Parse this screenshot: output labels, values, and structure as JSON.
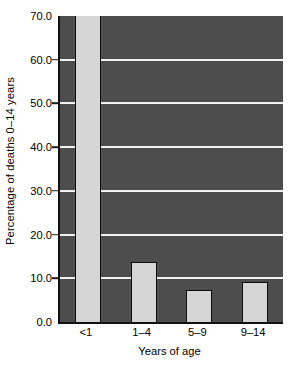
{
  "chart_data": {
    "type": "bar",
    "title": "",
    "xlabel": "Years of age",
    "ylabel": "Percentage of deaths 0–14 years",
    "categories": [
      "<1",
      "1–4",
      "5–9",
      "9–14"
    ],
    "values": [
      70.0,
      13.7,
      7.3,
      9.2
    ],
    "ylim": [
      0.0,
      70.0
    ],
    "ytick_values": [
      0.0,
      10.0,
      20.0,
      30.0,
      40.0,
      50.0,
      60.0,
      70.0
    ],
    "ytick_labels": [
      "0.0",
      "10.0",
      "20.0",
      "30.0",
      "40.0",
      "50.0",
      "60.0",
      "70.0"
    ],
    "grid": true,
    "grid_axis": "y",
    "legend": false,
    "legend_position": "none",
    "colors": {
      "plot_background": "#4d4d4d",
      "bar_fill": "#d6d6d6",
      "bar_edge": "#0d0d0d",
      "gridline": "#f2f2f2",
      "axis_line": "#111111",
      "text": "#000000",
      "figure_background": "#ffffff"
    }
  }
}
